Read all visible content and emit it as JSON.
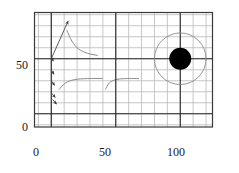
{
  "figure": {
    "background_color": "#ffffff",
    "frame_color": "#3a3a3a",
    "grid_color": "#b9b9b9",
    "axis_color": "#262626",
    "marker_color": "#000000",
    "streamline_color": "#8a8a8a",
    "arrow_color": "#4a4a4a"
  },
  "chart_data": {
    "type": "scatter",
    "title": "",
    "subtitle": "",
    "xlabel": "",
    "ylabel": "",
    "xlim": [
      -13,
      125
    ],
    "ylim": [
      -12,
      92
    ],
    "grid": true,
    "legend": null,
    "legend_position": "none",
    "xticks": [
      0,
      50,
      100
    ],
    "xtick_labels": [
      "0",
      "50",
      "100"
    ],
    "yticks": [
      0,
      50
    ],
    "ytick_labels": [
      "0",
      "50"
    ],
    "grid_step_x": 10,
    "grid_step_y": 10,
    "emphasized_gridlines_x": [
      0,
      50,
      100
    ],
    "emphasized_gridlines_y": [
      0,
      50
    ],
    "series": [
      {
        "name": "body",
        "type": "disk",
        "x": 100,
        "y": 50,
        "radius_data": 8.5,
        "fill": "#000000",
        "label": ""
      },
      {
        "name": "outer-circle",
        "type": "circle",
        "x": 100,
        "y": 50,
        "radius_data": 20,
        "fill": "none",
        "stroke": "#8a8a8a",
        "label": ""
      }
    ],
    "vectors": [
      {
        "name": "main-vector",
        "x0": 0,
        "y0": 50,
        "x1": 13,
        "y1": 84
      },
      {
        "name": "edge-vector-1",
        "x0": 0,
        "y0": 52,
        "x1": 1.5,
        "y1": 48
      },
      {
        "name": "edge-vector-2",
        "x0": 0,
        "y0": 40,
        "x1": 2.0,
        "y1": 36
      },
      {
        "name": "edge-vector-3",
        "x0": 0,
        "y0": 30,
        "x1": 2.5,
        "y1": 26
      },
      {
        "name": "edge-vector-4",
        "x0": 0,
        "y0": 19,
        "x1": 3.0,
        "y1": 15
      },
      {
        "name": "edge-vector-5",
        "x0": 1,
        "y0": 13,
        "x1": 4.0,
        "y1": 9
      }
    ],
    "streamlines": [
      {
        "name": "streamline-upper",
        "points": [
          [
            12,
            76
          ],
          [
            16,
            66
          ],
          [
            21,
            59
          ],
          [
            28,
            55
          ],
          [
            36,
            53
          ]
        ]
      },
      {
        "name": "streamline-lower-left",
        "points": [
          [
            6,
            22
          ],
          [
            11,
            28
          ],
          [
            18,
            31
          ],
          [
            28,
            32
          ],
          [
            40,
            32
          ]
        ]
      },
      {
        "name": "streamline-lower-right",
        "points": [
          [
            68,
            32
          ],
          [
            58,
            32
          ],
          [
            50,
            31
          ],
          [
            45,
            28
          ],
          [
            42,
            22
          ]
        ]
      }
    ],
    "annotations": []
  },
  "axes": {
    "y_labels": [
      {
        "text": "50",
        "value": 50
      },
      {
        "text": "0",
        "value": 0
      }
    ],
    "x_labels": [
      {
        "text": "0",
        "value": 0
      },
      {
        "text": "50",
        "value": 50
      },
      {
        "text": "100",
        "value": 100
      }
    ]
  }
}
